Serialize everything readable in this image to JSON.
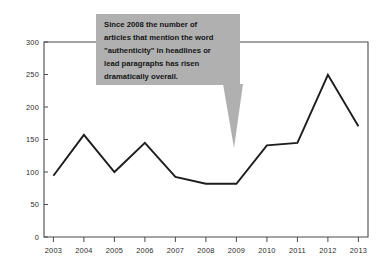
{
  "chart_data": {
    "type": "line",
    "title": "",
    "xlabel": "",
    "ylabel": "",
    "categories": [
      "2003",
      "2004",
      "2005",
      "2006",
      "2007",
      "2008",
      "2009",
      "2010",
      "2011",
      "2012",
      "2013"
    ],
    "x": [
      2003,
      2004,
      2005,
      2006,
      2007,
      2008,
      2009,
      2010,
      2011,
      2012,
      2013
    ],
    "values": [
      99,
      165,
      105,
      152,
      97,
      86,
      86,
      148,
      152,
      262,
      179
    ],
    "series": [
      {
        "name": "articles mentioning \"authenticity\"",
        "values": [
          99,
          165,
          105,
          152,
          97,
          86,
          86,
          148,
          152,
          262,
          179
        ]
      }
    ],
    "ylim": [
      0,
      315
    ],
    "xlim": [
      2002.5,
      2013.5
    ],
    "yticks": [
      0,
      50,
      100,
      150,
      200,
      250,
      300
    ],
    "ytick_labels": [
      "0",
      "50",
      "100",
      "150",
      "200",
      "250",
      "300"
    ],
    "xtick_labels": [
      "2003",
      "2004",
      "2005",
      "2006",
      "2007",
      "2008",
      "2009",
      "2010",
      "2011",
      "2012",
      "2013"
    ],
    "grid": false,
    "legend": "none",
    "line_color": "#1d1d1d",
    "axis_color": "#4a4a4a",
    "background_color": "#ffffff",
    "annotations": [
      {
        "id": "authenticity-callout",
        "fill_color": "#b0b0b0",
        "text_lines": [
          "Since  2008 the number of",
          "articles that mention the word",
          "\"authenticity\" in headlines or",
          "lead paragraphs has risen",
          "dramatically overall."
        ],
        "full_text": "Since 2008 the number of articles that mention the word \"authenticity\" in headlines or lead paragraphs has risen dramatically overall.",
        "points_at_year": "2009"
      }
    ]
  }
}
